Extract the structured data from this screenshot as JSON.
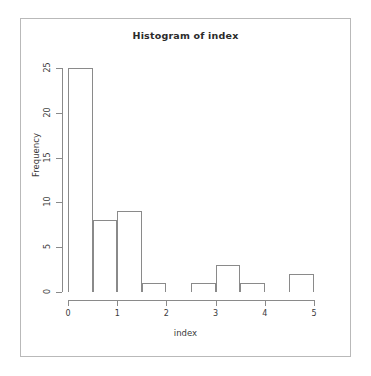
{
  "chart_data": {
    "type": "bar",
    "title": "Histogram of index",
    "xlabel": "index",
    "ylabel": "Frequency",
    "categories": [
      "0-0.5",
      "0.5-1",
      "1-1.5",
      "1.5-2",
      "2-2.5",
      "2.5-3",
      "3-3.5",
      "3.5-4",
      "4-4.5",
      "4.5-5"
    ],
    "bin_edges": [
      0,
      0.5,
      1,
      1.5,
      2,
      2.5,
      3,
      3.5,
      4,
      4.5,
      5
    ],
    "values": [
      25,
      8,
      9,
      1,
      0,
      1,
      3,
      1,
      0,
      2
    ],
    "bin_width": 0.5,
    "xlim": [
      0,
      5
    ],
    "ylim": [
      0,
      25
    ],
    "xticks": [
      0,
      1,
      2,
      3,
      4,
      5
    ],
    "yticks": [
      0,
      5,
      10,
      15,
      20,
      25
    ],
    "grid": false,
    "legend": false,
    "bar_fill": "#ffffff",
    "bar_border": "#8a8a8a",
    "axis_color": "#8a8a8a",
    "text_color": "#3a3a3a",
    "background": "#ffffff"
  }
}
